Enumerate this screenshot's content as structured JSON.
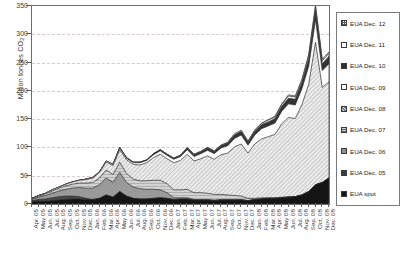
{
  "chart_data": {
    "type": "area",
    "title": "",
    "subtitle": "",
    "xlabel": "",
    "ylabel": "Million tonnes CO2",
    "ylabel_html": "Million tonnes CO₂",
    "ylim": [
      0,
      350
    ],
    "yticks": [
      0,
      50,
      100,
      150,
      200,
      250,
      300,
      350
    ],
    "ytick_labels": [
      "0",
      "50",
      "100",
      "150",
      "200",
      "250",
      "300",
      "350"
    ],
    "grid": "horizontal-dashed",
    "stacked": true,
    "legend_position": "right-outside",
    "legend_entries": [
      "EUA Dec. 12",
      "EUA Dec. 11",
      "EUA Dec. 10",
      "EUA Dec. 09",
      "EUA Dec. 08",
      "EUA Dec. 07",
      "EUA Dec. 06",
      "EUA Dec. 05",
      "EUA spot"
    ],
    "categories": [
      "Apr. 05",
      "May 05",
      "Jun. 05",
      "Jul. 05",
      "Aug. 05",
      "Sep. 05",
      "Oct. 05",
      "Nov. 05",
      "Dec. 05",
      "Jan. 06",
      "Feb. 06",
      "Mar. 06",
      "Apr. 06",
      "May 06",
      "Jun. 06",
      "Jul. 06",
      "Aug. 06",
      "Sep. 06",
      "Oct. 06",
      "Nov. 06",
      "Dec. 06",
      "Jan. 07",
      "Feb. 07",
      "Mar. 07",
      "Apr. 07",
      "May 07",
      "Jun. 07",
      "Jul. 07",
      "Aug. 07",
      "Sep. 07",
      "Oct. 07",
      "Nov. 07",
      "Dec. 07",
      "Jan. 08",
      "Feb. 08",
      "Mar. 08",
      "Apr. 08",
      "May 08",
      "Jun. 08",
      "Jul. 08",
      "Aug. 08",
      "Sep. 08",
      "Oct. 08",
      "Nov. 08",
      "Dec. 08"
    ],
    "series": [
      {
        "name": "EUA spot",
        "values": [
          4,
          5,
          5,
          6,
          7,
          8,
          9,
          9,
          8,
          8,
          10,
          16,
          12,
          22,
          14,
          10,
          9,
          9,
          10,
          11,
          10,
          8,
          9,
          9,
          7,
          7,
          7,
          6,
          7,
          7,
          7,
          7,
          6,
          8,
          9,
          10,
          10,
          11,
          12,
          13,
          16,
          22,
          34,
          38,
          46
        ]
      },
      {
        "name": "EUA Dec. 05",
        "values": [
          2,
          3,
          4,
          5,
          6,
          6,
          5,
          4,
          2,
          0,
          0,
          0,
          0,
          0,
          0,
          0,
          0,
          0,
          0,
          0,
          0,
          0,
          0,
          0,
          0,
          0,
          0,
          0,
          0,
          0,
          0,
          0,
          0,
          0,
          0,
          0,
          0,
          0,
          0,
          0,
          0,
          0,
          0,
          0,
          0
        ]
      },
      {
        "name": "EUA Dec. 06",
        "values": [
          3,
          4,
          6,
          8,
          10,
          12,
          14,
          16,
          18,
          20,
          24,
          30,
          26,
          34,
          24,
          20,
          18,
          17,
          16,
          14,
          10,
          3,
          2,
          2,
          1,
          1,
          1,
          1,
          1,
          1,
          1,
          1,
          0,
          0,
          0,
          0,
          0,
          0,
          0,
          0,
          0,
          0,
          0,
          0,
          0
        ]
      },
      {
        "name": "EUA Dec. 07",
        "values": [
          1,
          2,
          3,
          4,
          5,
          6,
          7,
          8,
          9,
          10,
          12,
          14,
          14,
          18,
          16,
          14,
          14,
          15,
          16,
          17,
          16,
          14,
          14,
          15,
          12,
          12,
          11,
          10,
          9,
          8,
          7,
          6,
          4,
          2,
          2,
          1,
          1,
          1,
          1,
          0,
          0,
          0,
          0,
          0,
          0
        ]
      },
      {
        "name": "EUA Dec. 08",
        "values": [
          0,
          1,
          1,
          2,
          2,
          3,
          4,
          5,
          6,
          8,
          10,
          14,
          16,
          22,
          24,
          26,
          28,
          32,
          40,
          46,
          44,
          48,
          52,
          62,
          56,
          60,
          66,
          62,
          70,
          74,
          86,
          92,
          80,
          96,
          104,
          108,
          112,
          130,
          140,
          138,
          160,
          190,
          252,
          168,
          170
        ]
      },
      {
        "name": "EUA Dec. 09",
        "values": [
          0,
          0,
          0,
          0,
          0,
          0,
          0,
          0,
          1,
          1,
          1,
          2,
          2,
          3,
          3,
          3,
          4,
          4,
          5,
          6,
          6,
          6,
          7,
          8,
          8,
          9,
          10,
          10,
          12,
          13,
          15,
          16,
          14,
          16,
          18,
          19,
          20,
          22,
          24,
          24,
          28,
          32,
          40,
          30,
          32
        ]
      },
      {
        "name": "EUA Dec. 10",
        "values": [
          0,
          0,
          0,
          0,
          0,
          0,
          0,
          0,
          0,
          0,
          0,
          0,
          0,
          1,
          1,
          1,
          1,
          1,
          2,
          2,
          2,
          2,
          2,
          3,
          3,
          3,
          4,
          4,
          4,
          5,
          6,
          6,
          5,
          6,
          7,
          7,
          8,
          9,
          10,
          10,
          11,
          13,
          16,
          12,
          13
        ]
      },
      {
        "name": "EUA Dec. 11",
        "values": [
          0,
          0,
          0,
          0,
          0,
          0,
          0,
          0,
          0,
          0,
          0,
          0,
          0,
          0,
          0,
          0,
          0,
          0,
          0,
          0,
          0,
          0,
          0,
          1,
          1,
          1,
          1,
          1,
          1,
          1,
          2,
          2,
          2,
          2,
          2,
          3,
          3,
          3,
          4,
          4,
          4,
          5,
          6,
          5,
          5
        ]
      },
      {
        "name": "EUA Dec. 12",
        "values": [
          0,
          0,
          0,
          0,
          0,
          0,
          0,
          0,
          0,
          0,
          0,
          0,
          0,
          0,
          0,
          0,
          0,
          0,
          0,
          0,
          0,
          0,
          0,
          0,
          0,
          0,
          0,
          0,
          0,
          0,
          0,
          0,
          0,
          1,
          1,
          1,
          1,
          1,
          2,
          2,
          2,
          3,
          4,
          3,
          3
        ]
      }
    ]
  }
}
